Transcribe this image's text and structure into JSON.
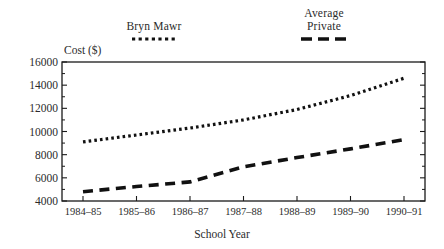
{
  "chart_data": {
    "type": "line",
    "title": "",
    "xlabel": "School Year",
    "ylabel": "Cost ($)",
    "categories": [
      "1984–85",
      "1985–86",
      "1986–87",
      "1987–88",
      "1988–89",
      "1989–90",
      "1990–91"
    ],
    "ylim": [
      4000,
      16000
    ],
    "ytick_values": [
      4000,
      6000,
      8000,
      10000,
      12000,
      14000,
      16000
    ],
    "ytick_labels": [
      "4000",
      "6000",
      "8000",
      "10000",
      "12000",
      "14000",
      "16000"
    ],
    "minor_tick_interval": 1000,
    "grid": false,
    "legend_position": "above-plot",
    "series": [
      {
        "name": "Bryn Mawr",
        "legend_label": "Bryn Mawr",
        "style": "dotted",
        "color": "#111111",
        "values": [
          9100,
          9700,
          10300,
          11000,
          11900,
          13100,
          14600
        ]
      },
      {
        "name": "Average Private",
        "legend_label": "Average\nPrivate",
        "style": "dashed",
        "color": "#111111",
        "values": [
          4800,
          5250,
          5650,
          6950,
          7750,
          8500,
          9300
        ]
      }
    ]
  },
  "axis_frame": {
    "left_px": 62,
    "right_px": 425,
    "top_px": 62,
    "bottom_px": 201
  },
  "colors": {
    "background": "#ffffff",
    "axis": "#1a1a1a",
    "text": "#2b2b2b",
    "series": "#111111"
  }
}
